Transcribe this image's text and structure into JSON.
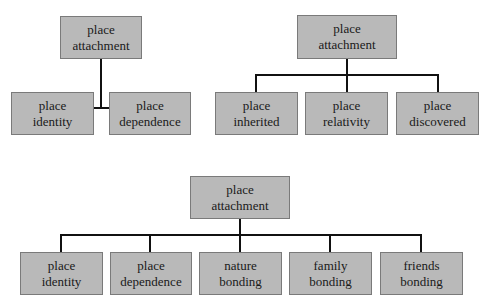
{
  "diagrams": [
    {
      "root": {
        "line1": "place",
        "line2": "attachment"
      },
      "children": [
        {
          "line1": "place",
          "line2": "identity"
        },
        {
          "line1": "place",
          "line2": "dependence"
        }
      ]
    },
    {
      "root": {
        "line1": "place",
        "line2": "attachment"
      },
      "children": [
        {
          "line1": "place",
          "line2": "inherited"
        },
        {
          "line1": "place",
          "line2": "relativity"
        },
        {
          "line1": "place",
          "line2": "discovered"
        }
      ]
    },
    {
      "root": {
        "line1": "place",
        "line2": "attachment"
      },
      "children": [
        {
          "line1": "place",
          "line2": "identity"
        },
        {
          "line1": "place",
          "line2": "dependence"
        },
        {
          "line1": "nature",
          "line2": "bonding"
        },
        {
          "line1": "family",
          "line2": "bonding"
        },
        {
          "line1": "friends",
          "line2": "bonding"
        }
      ]
    }
  ],
  "colors": {
    "box_fill": "#b9b9b9",
    "box_border": "#7a7a7a",
    "connector": "#111111"
  }
}
